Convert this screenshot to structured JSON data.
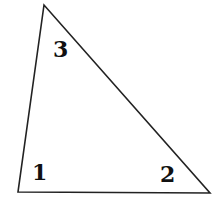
{
  "diagram": {
    "type": "triangle",
    "stroke_color": "#222222",
    "background": "#ffffff",
    "vertices": [
      {
        "name": "top",
        "x": 44,
        "y": 5
      },
      {
        "name": "bottom-left",
        "x": 18,
        "y": 192
      },
      {
        "name": "bottom-right",
        "x": 210,
        "y": 193
      }
    ],
    "angle_labels": [
      {
        "id": "1",
        "text": "1",
        "position": "bottom-left angle"
      },
      {
        "id": "2",
        "text": "2",
        "position": "bottom-right angle"
      },
      {
        "id": "3",
        "text": "3",
        "position": "top angle"
      }
    ]
  }
}
